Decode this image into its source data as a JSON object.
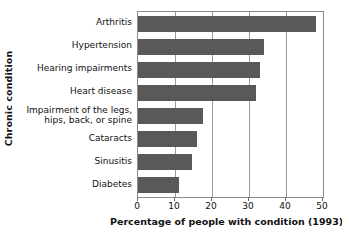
{
  "chart_data": {
    "type": "bar",
    "orientation": "horizontal",
    "title": "",
    "xlabel": "Percentage of people with condition (1993)",
    "ylabel": "Chronic condition",
    "categories": [
      "Arthritis",
      "Hypertension",
      "Hearing impairments",
      "Heart disease",
      "Impairment of the legs,\nhips, back, or spine",
      "Cataracts",
      "Sinusitis",
      "Diabetes"
    ],
    "values": [
      48,
      34,
      33,
      32,
      17.5,
      16,
      14.5,
      11
    ],
    "xlim": [
      0,
      50
    ],
    "xticks": [
      0,
      10,
      20,
      30,
      40,
      50
    ],
    "xtick_labels": [
      "0",
      "10",
      "20",
      "30",
      "40",
      "50"
    ],
    "grid": "vertical",
    "legend": "none",
    "bar_color": "#595959",
    "plot_border_color": "#8a8a8a",
    "gridline_color": "#9a9a9a",
    "background_color": "#ffffff"
  }
}
